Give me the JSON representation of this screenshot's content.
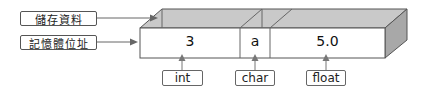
{
  "labels": {
    "data": "儲存資料",
    "address": "記憶體位址"
  },
  "cells": [
    {
      "value": "3",
      "type": "int"
    },
    {
      "value": "a",
      "type": "char"
    },
    {
      "value": "5.0",
      "type": "float"
    }
  ],
  "colors": {
    "top_face": "#c8c8c8",
    "side_face": "#a9a9a9",
    "front_face": "#ffffff",
    "stroke": "#555555"
  }
}
